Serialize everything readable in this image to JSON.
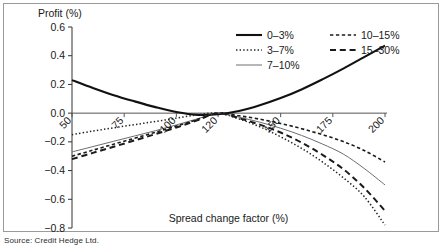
{
  "figure": {
    "source_note": "Source: Credit Hedge Ltd.",
    "frame_color": "#9a9a9a"
  },
  "chart_data": {
    "type": "line",
    "title": "",
    "ylabel": "Profit (%)",
    "xlabel": "Spread change factor (%)",
    "xlim": [
      50,
      200
    ],
    "ylim": [
      -0.8,
      0.6
    ],
    "yticks": [
      "0.6",
      "0.4",
      "0.2",
      "0.0",
      "-0.2",
      "-0.4",
      "-0.6",
      "-0.8"
    ],
    "ytick_values": [
      0.6,
      0.4,
      0.2,
      0.0,
      -0.2,
      -0.4,
      -0.6,
      -0.8
    ],
    "xticks": [
      "50",
      "75",
      "100",
      "120",
      "150",
      "175",
      "200"
    ],
    "xtick_values": [
      50,
      75,
      100,
      120,
      150,
      175,
      200
    ],
    "xtick_rotation": 45,
    "grid": false,
    "legend_position": "upper right",
    "x": [
      50,
      60,
      70,
      80,
      90,
      100,
      110,
      120,
      130,
      140,
      150,
      160,
      170,
      180,
      190,
      200
    ],
    "series": [
      {
        "name": "0-3%",
        "label": "0–3%",
        "style": "solid",
        "width": 2.1,
        "color": "#111111",
        "values": [
          0.23,
          0.175,
          0.125,
          0.082,
          0.042,
          0.008,
          -0.012,
          -0.008,
          0.015,
          0.055,
          0.105,
          0.165,
          0.235,
          0.31,
          0.39,
          0.47
        ]
      },
      {
        "name": "3-7%",
        "label": "3–7%",
        "style": "dotted",
        "width": 1.5,
        "color": "#222222",
        "values": [
          -0.15,
          -0.125,
          -0.102,
          -0.08,
          -0.058,
          -0.035,
          -0.012,
          0.0,
          -0.04,
          -0.095,
          -0.165,
          -0.245,
          -0.34,
          -0.45,
          -0.58,
          -0.78
        ]
      },
      {
        "name": "7-10%",
        "label": "7–10%",
        "style": "solid",
        "width": 1.0,
        "color": "#6e6e6e",
        "values": [
          -0.27,
          -0.233,
          -0.196,
          -0.159,
          -0.122,
          -0.082,
          -0.04,
          0.0,
          -0.028,
          -0.063,
          -0.105,
          -0.155,
          -0.215,
          -0.285,
          -0.385,
          -0.5
        ]
      },
      {
        "name": "10-15%",
        "label": "10–15%",
        "style": "dashed-fine",
        "width": 1.6,
        "color": "#1a1a1a",
        "values": [
          -0.3,
          -0.258,
          -0.216,
          -0.175,
          -0.133,
          -0.09,
          -0.045,
          0.0,
          -0.018,
          -0.042,
          -0.072,
          -0.108,
          -0.15,
          -0.198,
          -0.26,
          -0.34
        ]
      },
      {
        "name": "15-30%",
        "label": "15–30%",
        "style": "dashed-bold",
        "width": 2.0,
        "color": "#1a1a1a",
        "values": [
          -0.32,
          -0.277,
          -0.234,
          -0.19,
          -0.146,
          -0.1,
          -0.05,
          0.0,
          -0.035,
          -0.08,
          -0.135,
          -0.205,
          -0.29,
          -0.39,
          -0.52,
          -0.68
        ]
      }
    ],
    "legend": [
      {
        "label": "0–3%",
        "style": "solid",
        "width": 2.1,
        "color": "#111111"
      },
      {
        "label": "3–7%",
        "style": "dotted",
        "width": 1.5,
        "color": "#222222"
      },
      {
        "label": "7–10%",
        "style": "solid",
        "width": 1.0,
        "color": "#6e6e6e"
      },
      {
        "label": "10–15%",
        "style": "dashed-fine",
        "width": 1.6,
        "color": "#1a1a1a"
      },
      {
        "label": "15–30%",
        "style": "dashed-bold",
        "width": 2.0,
        "color": "#1a1a1a"
      }
    ]
  }
}
